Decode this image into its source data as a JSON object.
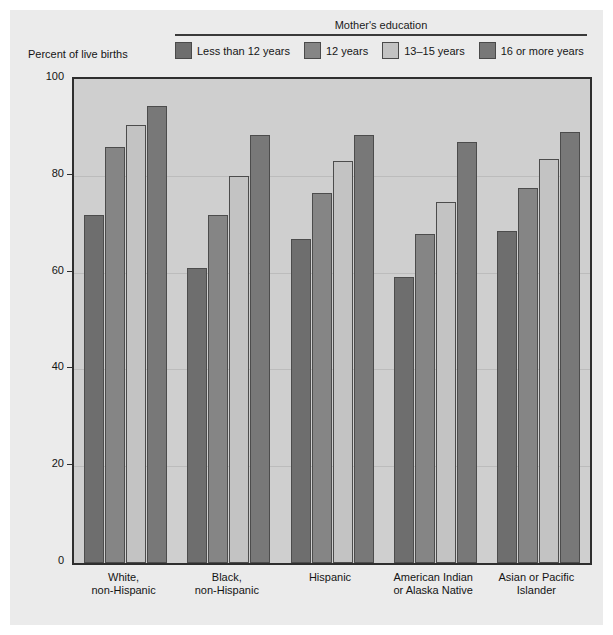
{
  "chart_data": {
    "type": "bar",
    "title": "",
    "legend_title": "Mother's education",
    "ylabel": "Percent of live births",
    "xlabel": "",
    "ylim": [
      0,
      100
    ],
    "yticks": [
      0,
      20,
      40,
      60,
      80,
      100
    ],
    "grid": true,
    "legend_position": "top",
    "categories": [
      "White,\nnon-Hispanic",
      "Black,\nnon-Hispanic",
      "Hispanic",
      "American Indian\nor Alaska Native",
      "Asian or Pacific\nIslander"
    ],
    "series": [
      {
        "name": "Less than 12 years",
        "color": "#6e6e6e",
        "values": [
          72,
          61,
          67,
          59,
          68.5
        ]
      },
      {
        "name": "12 years",
        "color": "#858585",
        "values": [
          86,
          72,
          76.5,
          68,
          77.5
        ]
      },
      {
        "name": "13–15 years",
        "color": "#c3c3c3",
        "values": [
          90.5,
          80,
          83,
          74.5,
          83.5
        ]
      },
      {
        "name": "16 or more years",
        "color": "#787878",
        "values": [
          94.5,
          88.5,
          88.5,
          87,
          89
        ]
      }
    ]
  },
  "colors": {
    "page_background": "#ffffff",
    "panel_background": "#ebebeb",
    "plot_background": "#cfcfcf",
    "axis": "#2e2e2e",
    "gridline": "#bcbcbc",
    "text": "#141414"
  }
}
